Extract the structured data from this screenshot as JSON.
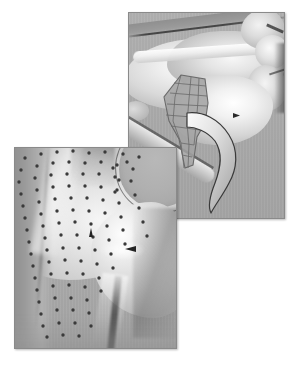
{
  "figure": {
    "kind": "two-panel grayscale 3D surface rendering",
    "background_color": "#ffffff",
    "caption": "",
    "panels": [
      {
        "id": "top-right",
        "name": "mesh-patch-render",
        "x": 128,
        "y": 12,
        "width": 155,
        "height": 205,
        "background_color": "#ababab",
        "border_color": "#8a8a8a",
        "description": "Smooth shaded anatomical surface with a quadrilateral wireframe mesh patch and a curved hook-shaped process",
        "features": [
          {
            "name": "wireframe-mesh-patch",
            "rows": 7,
            "cols": 4,
            "color": "#6d6d6d"
          },
          {
            "name": "hook-process",
            "color": "#9a9a9a"
          },
          {
            "name": "upper-crease-line",
            "color": "#3a3a3a"
          },
          {
            "name": "arrow-marker",
            "color": "#2a2a2a"
          }
        ]
      },
      {
        "id": "bottom-left",
        "name": "landmark-points-render",
        "x": 14,
        "y": 147,
        "width": 161,
        "height": 200,
        "background_color": "#ababab",
        "border_color": "#8a8a8a",
        "description": "Smooth shaded anatomical surface overlaid with a scattered grid of dark landmark points",
        "features": [
          {
            "name": "landmark-dots",
            "count": 104,
            "color": "#3c3c3c",
            "radius_px": 1.6
          },
          {
            "name": "rounded-bulb",
            "color": "#adadad"
          },
          {
            "name": "arrow-marker-upper",
            "color": "#232323"
          },
          {
            "name": "arrow-marker-lower",
            "color": "#232323"
          }
        ]
      }
    ]
  },
  "mesh": {
    "stroke": "#6a6a6a",
    "fill": "#a2a2a2",
    "outline": "M 20 2 L 44 6 L 47 30 L 44 50 L 36 64 L 32 92 L 24 95 L 18 66 L 8 48 L 3 24 Z",
    "u_lines": [
      "M 13 10 L 45 13",
      "M 9 20 L 46 23",
      "M 6 31 L 46 33",
      "M 5 42 L 44 45",
      "M 10 53 L 39 57",
      "M 20 70 L 33 72",
      "M 21 82 L 31 84"
    ],
    "v_lines": [
      "M 20 2 L 14 24 L 12 48 L 20 70 L 23 95",
      "M 30 4 L 28 26 L 26 50 L 28 72 L 27 95",
      "M 38 5 L 37 28 L 35 52 L 33 72"
    ]
  },
  "hook": {
    "fill_light": "#efefef",
    "fill_mid": "#c9c9c9",
    "stroke": "#3a3a3a",
    "path": "M 2 4 C 18 2 34 10 44 26 C 54 42 52 60 44 74 C 38 86 30 96 26 104 C 22 96 26 84 30 74 C 36 58 38 44 30 32 C 22 22 10 18 2 18 Z"
  },
  "dots": {
    "color": "#3a3a3a",
    "radius": 1.7,
    "points": [
      [
        10,
        10
      ],
      [
        26,
        6
      ],
      [
        42,
        4
      ],
      [
        58,
        3
      ],
      [
        74,
        5
      ],
      [
        90,
        4
      ],
      [
        108,
        6
      ],
      [
        124,
        9
      ],
      [
        6,
        22
      ],
      [
        22,
        18
      ],
      [
        38,
        15
      ],
      [
        54,
        14
      ],
      [
        70,
        15
      ],
      [
        86,
        14
      ],
      [
        102,
        17
      ],
      [
        118,
        21
      ],
      [
        4,
        34
      ],
      [
        20,
        30
      ],
      [
        36,
        27
      ],
      [
        52,
        26
      ],
      [
        68,
        26
      ],
      [
        84,
        26
      ],
      [
        100,
        29
      ],
      [
        116,
        33
      ],
      [
        6,
        46
      ],
      [
        22,
        42
      ],
      [
        38,
        39
      ],
      [
        54,
        38
      ],
      [
        70,
        38
      ],
      [
        86,
        39
      ],
      [
        102,
        42
      ],
      [
        120,
        47
      ],
      [
        8,
        58
      ],
      [
        24,
        54
      ],
      [
        40,
        51
      ],
      [
        56,
        50
      ],
      [
        72,
        50
      ],
      [
        88,
        52
      ],
      [
        104,
        55
      ],
      [
        124,
        60
      ],
      [
        10,
        70
      ],
      [
        26,
        66
      ],
      [
        42,
        63
      ],
      [
        58,
        62
      ],
      [
        74,
        63
      ],
      [
        90,
        65
      ],
      [
        106,
        69
      ],
      [
        128,
        74
      ],
      [
        12,
        82
      ],
      [
        28,
        78
      ],
      [
        44,
        75
      ],
      [
        60,
        74
      ],
      [
        76,
        76
      ],
      [
        92,
        78
      ],
      [
        108,
        82
      ],
      [
        132,
        88
      ],
      [
        14,
        94
      ],
      [
        30,
        90
      ],
      [
        46,
        87
      ],
      [
        62,
        87
      ],
      [
        78,
        89
      ],
      [
        94,
        92
      ],
      [
        110,
        96
      ],
      [
        16,
        106
      ],
      [
        32,
        102
      ],
      [
        48,
        100
      ],
      [
        64,
        100
      ],
      [
        80,
        102
      ],
      [
        96,
        106
      ],
      [
        18,
        118
      ],
      [
        34,
        114
      ],
      [
        50,
        112
      ],
      [
        66,
        113
      ],
      [
        82,
        116
      ],
      [
        98,
        120
      ],
      [
        20,
        130
      ],
      [
        36,
        126
      ],
      [
        52,
        125
      ],
      [
        68,
        126
      ],
      [
        84,
        130
      ],
      [
        22,
        142
      ],
      [
        38,
        138
      ],
      [
        54,
        137
      ],
      [
        70,
        139
      ],
      [
        86,
        143
      ],
      [
        24,
        154
      ],
      [
        40,
        150
      ],
      [
        56,
        150
      ],
      [
        72,
        152
      ],
      [
        26,
        166
      ],
      [
        42,
        162
      ],
      [
        58,
        162
      ],
      [
        74,
        165
      ],
      [
        28,
        178
      ],
      [
        44,
        175
      ],
      [
        60,
        175
      ],
      [
        76,
        178
      ],
      [
        32,
        189
      ],
      [
        48,
        187
      ],
      [
        64,
        188
      ],
      [
        100,
        44
      ],
      [
        104,
        32
      ],
      [
        98,
        20
      ],
      [
        112,
        14
      ]
    ]
  }
}
